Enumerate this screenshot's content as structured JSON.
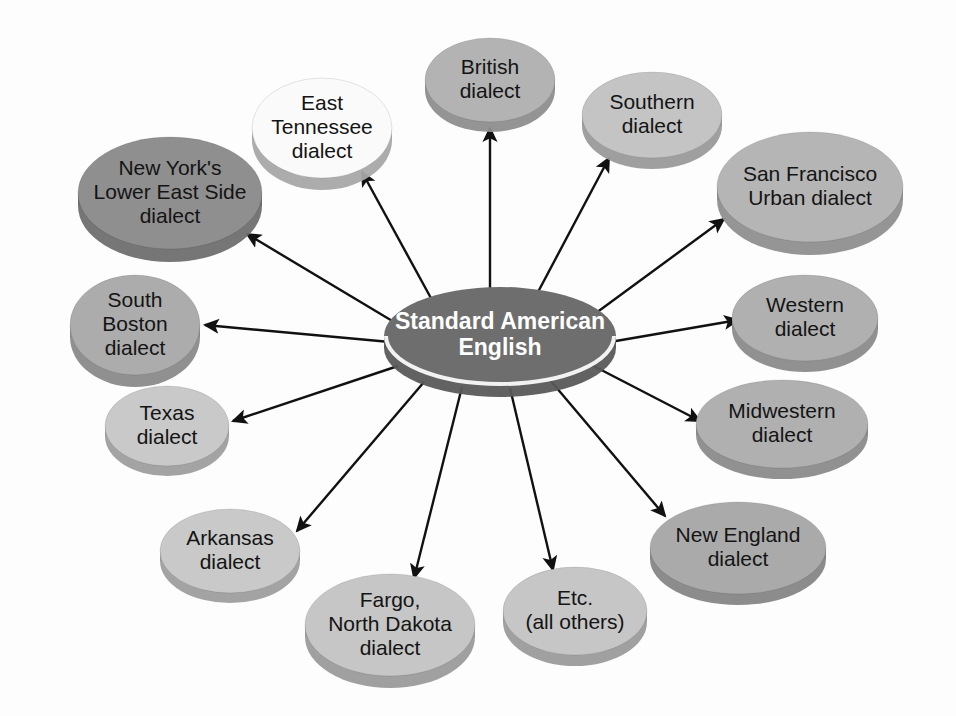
{
  "diagram": {
    "type": "radial-hub-and-spoke",
    "background_color": "#fdfdfd",
    "edge_color": "#111111",
    "center": {
      "label_lines": [
        "Standard American",
        "English"
      ],
      "label": "Standard American English",
      "fill": "#6e6e6e",
      "side_fill": "#5a5a5a",
      "text_color": "#ffffff",
      "cx": 500,
      "cy": 336,
      "rx": 116,
      "ry": 49,
      "font_size": 23,
      "bold": true,
      "highlight_ring": "#f2f2f2"
    },
    "nodes": [
      {
        "id": "british",
        "label_lines": [
          "British",
          "dialect"
        ],
        "label": "British dialect",
        "fill": "#b3b3b3",
        "side_fill": "#8e8e8e",
        "cx": 490,
        "cy": 80,
        "rx": 65,
        "ry": 42,
        "font_size": 21
      },
      {
        "id": "east-tennessee",
        "label_lines": [
          "East",
          "Tennessee",
          "dialect"
        ],
        "label": "East Tennessee dialect",
        "fill": "#fafafa",
        "side_fill": "#a8a8a8",
        "cx": 322,
        "cy": 128,
        "rx": 70,
        "ry": 50,
        "font_size": 21
      },
      {
        "id": "new-yorks-lower-east-side",
        "label_lines": [
          "New York's",
          "Lower East Side",
          "dialect"
        ],
        "label": "New York's Lower East Side dialect",
        "fill": "#8f8f8f",
        "side_fill": "#6f6f6f",
        "cx": 170,
        "cy": 193,
        "rx": 92,
        "ry": 56,
        "font_size": 21
      },
      {
        "id": "south-boston",
        "label_lines": [
          "South",
          "Boston",
          "dialect"
        ],
        "label": "South Boston dialect",
        "fill": "#acacac",
        "side_fill": "#8a8a8a",
        "cx": 135,
        "cy": 325,
        "rx": 65,
        "ry": 50,
        "font_size": 21
      },
      {
        "id": "texas",
        "label_lines": [
          "Texas",
          "dialect"
        ],
        "label": "Texas dialect",
        "fill": "#c9c9c9",
        "side_fill": "#9e9e9e",
        "cx": 167,
        "cy": 426,
        "rx": 62,
        "ry": 40,
        "font_size": 21
      },
      {
        "id": "arkansas",
        "label_lines": [
          "Arkansas",
          "dialect"
        ],
        "label": "Arkansas dialect",
        "fill": "#c9c9c9",
        "side_gray": "#9e9e9e",
        "side_fill": "#9e9e9e",
        "cx": 230,
        "cy": 551,
        "rx": 70,
        "ry": 42,
        "font_size": 21
      },
      {
        "id": "fargo-north-dakota",
        "label_lines": [
          "Fargo,",
          "North Dakota",
          "dialect"
        ],
        "label": "Fargo, North Dakota dialect",
        "fill": "#c6c6c6",
        "side_fill": "#9b9b9b",
        "cx": 390,
        "cy": 625,
        "rx": 85,
        "ry": 51,
        "font_size": 21
      },
      {
        "id": "etc-all-others",
        "label_lines": [
          "Etc.",
          "(all others)"
        ],
        "label": "Etc. (all others)",
        "fill": "#c6c6c6",
        "side_fill": "#9b9b9b",
        "cx": 575,
        "cy": 611,
        "rx": 72,
        "ry": 44,
        "font_size": 21
      },
      {
        "id": "new-england",
        "label_lines": [
          "New England",
          "dialect"
        ],
        "label": "New England dialect",
        "fill": "#aaaaaa",
        "side_fill": "#868686",
        "cx": 738,
        "cy": 548,
        "rx": 88,
        "ry": 46,
        "font_size": 21
      },
      {
        "id": "midwestern",
        "label_lines": [
          "Midwestern",
          "dialect"
        ],
        "label": "Midwestern dialect",
        "fill": "#b0b0b0",
        "side_fill": "#8b8b8b",
        "cx": 782,
        "cy": 424,
        "rx": 86,
        "ry": 44,
        "font_size": 21
      },
      {
        "id": "western",
        "label_lines": [
          "Western",
          "dialect"
        ],
        "label": "Western dialect",
        "fill": "#b0b0b0",
        "side_fill": "#8b8b8b",
        "cx": 805,
        "cy": 318,
        "rx": 73,
        "ry": 43,
        "font_size": 21
      },
      {
        "id": "san-francisco-urban",
        "label_lines": [
          "San Francisco",
          "Urban dialect"
        ],
        "label": "San Francisco Urban dialect",
        "fill": "#b5b5b5",
        "side_fill": "#8f8f8f",
        "cx": 810,
        "cy": 187,
        "rx": 93,
        "ry": 55,
        "font_size": 21
      },
      {
        "id": "southern",
        "label_lines": [
          "Southern",
          "dialect"
        ],
        "label": "Southern dialect",
        "fill": "#c4c4c4",
        "side_fill": "#9a9a9a",
        "cx": 652,
        "cy": 115,
        "rx": 70,
        "ry": 43,
        "font_size": 21
      }
    ],
    "edges": [
      {
        "from": "center",
        "to": "british",
        "x1": 490,
        "y1": 290,
        "x2": 490,
        "y2": 128
      },
      {
        "from": "center",
        "to": "east-tennessee",
        "x1": 432,
        "y1": 300,
        "x2": 362,
        "y2": 172
      },
      {
        "from": "center",
        "to": "new-yorks-lower-east-side",
        "x1": 394,
        "y1": 322,
        "x2": 247,
        "y2": 234
      },
      {
        "from": "center",
        "to": "south-boston",
        "x1": 390,
        "y1": 342,
        "x2": 205,
        "y2": 325
      },
      {
        "from": "center",
        "to": "texas",
        "x1": 398,
        "y1": 366,
        "x2": 233,
        "y2": 421
      },
      {
        "from": "center",
        "to": "arkansas",
        "x1": 424,
        "y1": 382,
        "x2": 297,
        "y2": 531
      },
      {
        "from": "center",
        "to": "fargo-north-dakota",
        "x1": 462,
        "y1": 387,
        "x2": 414,
        "y2": 578
      },
      {
        "from": "center",
        "to": "etc-all-others",
        "x1": 510,
        "y1": 388,
        "x2": 553,
        "y2": 570
      },
      {
        "from": "center",
        "to": "new-england",
        "x1": 550,
        "y1": 380,
        "x2": 665,
        "y2": 516
      },
      {
        "from": "center",
        "to": "midwestern",
        "x1": 582,
        "y1": 360,
        "x2": 700,
        "y2": 421
      },
      {
        "from": "center",
        "to": "western",
        "x1": 610,
        "y1": 342,
        "x2": 738,
        "y2": 320
      },
      {
        "from": "center",
        "to": "san-francisco-urban",
        "x1": 596,
        "y1": 313,
        "x2": 724,
        "y2": 219
      },
      {
        "from": "center",
        "to": "southern",
        "x1": 538,
        "y1": 292,
        "x2": 609,
        "y2": 158
      }
    ]
  }
}
